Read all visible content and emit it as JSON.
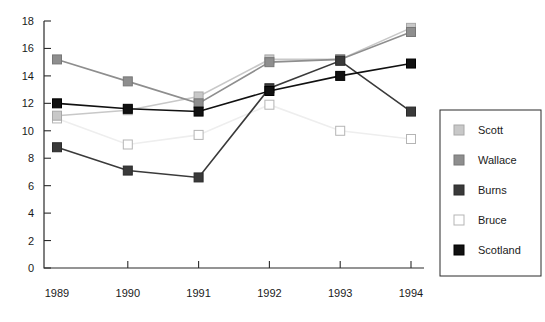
{
  "chart_data": {
    "type": "line",
    "title": "",
    "xlabel": "",
    "ylabel": "",
    "categories": [
      "1989",
      "1990",
      "1991",
      "1992",
      "1993",
      "1994"
    ],
    "ylim": [
      0,
      18
    ],
    "yticks": [
      0,
      2,
      4,
      6,
      8,
      10,
      12,
      14,
      16,
      18
    ],
    "ytick_labels": [
      "0",
      "2",
      "4",
      "6",
      "8",
      "10",
      "12",
      "14",
      "16",
      "18"
    ],
    "grid": false,
    "legend_position": "right",
    "series": [
      {
        "name": "Scott",
        "color": "#c8c8c8",
        "marker": "square",
        "marker_fill": "#c8c8c8",
        "marker_stroke": "#a8a8a8",
        "values": [
          11.1,
          11.5,
          12.5,
          15.2,
          15.2,
          17.5
        ]
      },
      {
        "name": "Wallace",
        "color": "#8e8e8e",
        "marker": "square",
        "marker_fill": "#8e8e8e",
        "marker_stroke": "#777777",
        "values": [
          15.2,
          13.6,
          12.0,
          15.0,
          15.2,
          17.2
        ]
      },
      {
        "name": "Burns",
        "color": "#3a3a3a",
        "marker": "square",
        "marker_fill": "#3a3a3a",
        "marker_stroke": "#2a2a2a",
        "values": [
          8.8,
          7.1,
          6.6,
          13.1,
          15.1,
          11.4
        ]
      },
      {
        "name": "Bruce",
        "color": "#eeeeee",
        "marker": "square",
        "marker_fill": "#ffffff",
        "marker_stroke": "#b5b5b5",
        "values": [
          10.9,
          9.0,
          9.7,
          11.9,
          10.0,
          9.4
        ]
      },
      {
        "name": "Scotland",
        "color": "#111111",
        "marker": "square",
        "marker_fill": "#111111",
        "marker_stroke": "#000000",
        "values": [
          12.0,
          11.6,
          11.4,
          12.9,
          14.0,
          14.9
        ]
      }
    ]
  },
  "legend": {
    "items": [
      {
        "label": "Scott"
      },
      {
        "label": "Wallace"
      },
      {
        "label": "Burns"
      },
      {
        "label": "Bruce"
      },
      {
        "label": "Scotland"
      }
    ]
  }
}
